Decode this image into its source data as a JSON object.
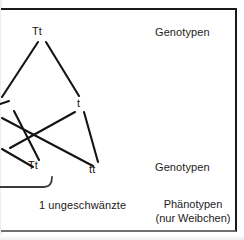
{
  "figure": {
    "type": "genetics-pedigree-cross",
    "language": "de",
    "border_color": "#1a1a1a",
    "line_color": "#141414",
    "background": "#ffffff"
  },
  "nodes": [
    {
      "id": "p-tt-top",
      "label": "Tt",
      "x": 40,
      "y": 32,
      "generation": "parental"
    },
    {
      "id": "f1-t-right",
      "label": "t",
      "x": 80,
      "y": 104,
      "generation": "gamete"
    },
    {
      "id": "f1-tt-left",
      "label": "Tt",
      "x": 36,
      "y": 166,
      "generation": "offspring"
    },
    {
      "id": "f1-tt-right",
      "label": "tt",
      "x": 96,
      "y": 170,
      "generation": "offspring"
    }
  ],
  "edges": [
    {
      "from": "p-tt-top",
      "to": "left-edge",
      "x1": 40,
      "y1": 42,
      "x2": 2,
      "y2": 96
    },
    {
      "from": "p-tt-top",
      "to": "f1-t-right",
      "x1": 46,
      "y1": 42,
      "x2": 78,
      "y2": 96
    },
    {
      "from": "f1-t-right",
      "to": "f1-tt-right",
      "x1": 83,
      "y1": 112,
      "x2": 97,
      "y2": 162
    },
    {
      "from": "f1-t-right",
      "to": "left-cross",
      "x1": 76,
      "y1": 112,
      "x2": 14,
      "y2": 147
    },
    {
      "from": "left-edge",
      "to": "f1-tt-right",
      "x1": 2,
      "y1": 120,
      "x2": 94,
      "y2": 166
    },
    {
      "from": "left-edge",
      "to": "f1-tt-left",
      "x1": 14,
      "y1": 113,
      "x2": 38,
      "y2": 160
    },
    {
      "from": "left-edge2",
      "to": "cross-short",
      "x1": 2,
      "y1": 148,
      "x2": 32,
      "y2": 166
    }
  ],
  "bracket": {
    "name": "offspring-bracket",
    "x1": 0,
    "y1": 186,
    "x2": 44,
    "y2": 186,
    "corner_x": 52,
    "corner_y": 176
  },
  "labels": {
    "genotypes_top": "Genotypen",
    "genotypes_bottom": "Genotypen",
    "phenotypes_line1": "Phänotypen",
    "phenotypes_line2": "(nur Weibchen)",
    "offspring_count": "1 ungeschwänzte"
  },
  "label_positions": {
    "genotypes_top": {
      "x": 155,
      "y": 26
    },
    "genotypes_bottom": {
      "x": 155,
      "y": 161
    },
    "phenotypes": {
      "x": 152,
      "y": 198
    },
    "offspring_count": {
      "x": 39,
      "y": 199
    }
  }
}
